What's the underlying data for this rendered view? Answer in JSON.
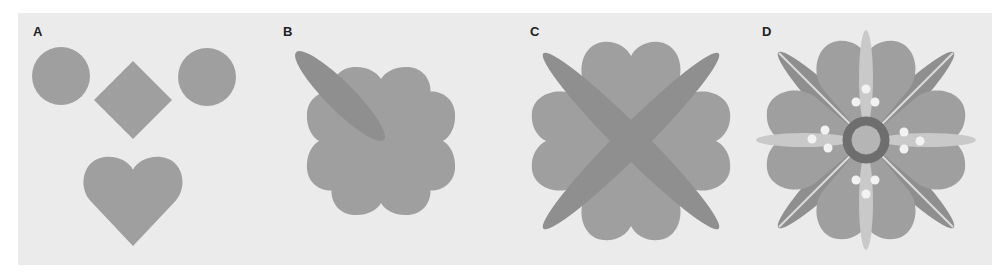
{
  "figure": {
    "background": "#ebebeb",
    "colors": {
      "shape": "#9f9f9f",
      "petal_dark": "#8f8f8f",
      "petal_light": "#c9c9c9",
      "ring": "#6e6e6e",
      "ring_inner": "#b5b5b5",
      "dot": "#f2f2f2",
      "vein": "#dcdcdc"
    },
    "panels": [
      {
        "id": "A",
        "label": "A",
        "description": "Primitive shapes: two circles, a diamond and a heart"
      },
      {
        "id": "B",
        "label": "B",
        "description": "Four hearts rotated around a centre with gaps, one diagonal ellipse"
      },
      {
        "id": "C",
        "label": "C",
        "description": "Four hearts joined at centre, four diagonal ellipses"
      },
      {
        "id": "D",
        "label": "D",
        "description": "Completed flower ornament with ring, light petals, veins and dots"
      }
    ]
  }
}
